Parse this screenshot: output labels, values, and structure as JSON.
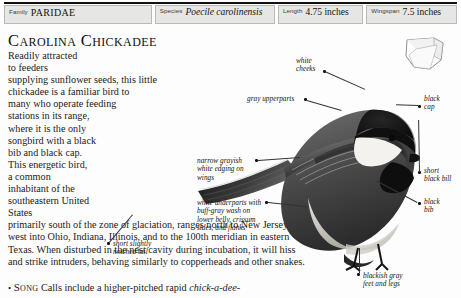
{
  "header": {
    "fields": [
      {
        "label": "Family",
        "value": "PARIDAE",
        "style": "smallcaps"
      },
      {
        "label": "Species",
        "value": "Poecile carolinensis",
        "style": "italic"
      },
      {
        "label": "Length",
        "value": "4.75 inches",
        "style": "plain"
      },
      {
        "label": "Wingspan",
        "value": "7.5 inches",
        "style": "plain"
      }
    ]
  },
  "article": {
    "title": "Carolina Chickadee",
    "paragraph_lines": [
      "Readily attracted to feeders supplying sunflower",
      "seeds, this little chickadee is a familiar bird to many",
      "who operate feeding stations in its range, where",
      "it is the only songbird with a black bib and",
      "black cap. This energetic bird, a common",
      "inhabitant of the southeastern United",
      "States primarily south of the zone of",
      "glaciation, ranges north to New",
      "Jersey and west into Ohio,",
      "Indiana, Illinois, and to the",
      "100th meridian in",
      "eastern Texas. When",
      "disturbed in the",
      "nest cavity during",
      "incubation, it will",
      "hiss and strike",
      "intruders,",
      "behaving similarly to",
      "copperheads and other snakes."
    ],
    "song": {
      "bullet": "•",
      "label": "Song",
      "text": "Calls include a higher-pitched rapid ",
      "italic_text": "chick-a-dee-"
    }
  },
  "callouts": [
    {
      "name": "white-cheeks",
      "lines": [
        "white",
        "cheeks"
      ]
    },
    {
      "name": "gray-upperparts",
      "lines": [
        "gray upperparts"
      ]
    },
    {
      "name": "wing-edging",
      "lines": [
        "narrow grayish",
        "white edging on",
        "wings"
      ]
    },
    {
      "name": "underparts",
      "lines": [
        "white underparts with",
        "buff-gray wash on",
        "lower belly, crissum",
        "sides, and flanks"
      ]
    },
    {
      "name": "notched-tail",
      "lines": [
        "short slightly",
        "notched tail"
      ]
    },
    {
      "name": "black-cap",
      "lines": [
        "black",
        "cap"
      ]
    },
    {
      "name": "black-bill",
      "lines": [
        "short",
        "black bill"
      ]
    },
    {
      "name": "black-bib",
      "lines": [
        "black",
        "bib"
      ]
    },
    {
      "name": "feet-and-legs",
      "lines": [
        "blackish gray",
        "feet and legs"
      ]
    }
  ],
  "colors": {
    "page_background": "#fdfdfd",
    "header_cell": "#e6e6e4",
    "header_border": "#b9b9b5",
    "text": "#1b1b1b",
    "rule": "#111111",
    "bird_dark": "#141414",
    "bird_gray": "#8d8d8d",
    "bird_light": "#d8d6d1"
  }
}
